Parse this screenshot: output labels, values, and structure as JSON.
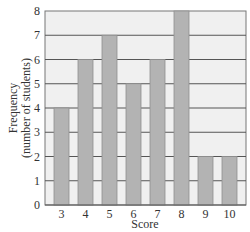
{
  "chart_data": {
    "type": "bar",
    "title": "",
    "xlabel": "Score",
    "ylabel": "Frequency\n(number of students)",
    "ylabel_lines": [
      "Frequency",
      "(number of students)"
    ],
    "categories": [
      "3",
      "4",
      "5",
      "6",
      "7",
      "8",
      "9",
      "10"
    ],
    "values": [
      4,
      6,
      7,
      5,
      6,
      8,
      2,
      2
    ],
    "ylim": [
      0,
      8
    ],
    "yticks": [
      "0",
      "1",
      "2",
      "3",
      "4",
      "5",
      "6",
      "7",
      "8"
    ],
    "grid": true,
    "legend": null,
    "colors": {
      "bar": "#b3b3b3",
      "bar_edge": "#8f8f8f",
      "plot_bg": "#f0f0f0",
      "grid": "#555555",
      "axis": "#555555"
    }
  }
}
